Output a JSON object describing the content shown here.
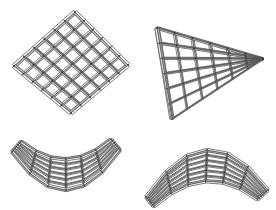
{
  "sheet": {
    "title": "Gridshell Structure Variations",
    "background_color": "#ffffff",
    "width": 276,
    "height": 210
  },
  "render_style": {
    "member_stroke": "#4a4a4a",
    "member_fill_light": "#f2f2f2",
    "member_fill_mid": "#c9c9c9",
    "member_fill_dark": "#8e8e8e",
    "node_color": "#3a3a3a",
    "edge_beam_light": "#e8e8e8",
    "edge_beam_dark": "#9b9b9b",
    "line_width": 0.7
  },
  "figures": [
    {
      "id": "flat-diamond-grid",
      "name": "flat-diamond-grid",
      "label": "Flat square lattice in plan rotated 45 degrees",
      "shape": "diamond",
      "grid_divisions_u": 6,
      "grid_divisions_v": 6,
      "curvature": "flat",
      "outline": [
        [
          75,
          12
        ],
        [
          128,
          65
        ],
        [
          71,
          113
        ],
        [
          14,
          66
        ]
      ],
      "node_count": 49
    },
    {
      "id": "triangular-grid",
      "name": "triangular-grid",
      "label": "Triangular wedge lattice in perspective",
      "shape": "triangle",
      "grid_divisions_u": 6,
      "grid_divisions_v": 6,
      "curvature": "flat",
      "outline": [
        [
          157,
          28
        ],
        [
          263,
          59
        ],
        [
          172,
          119
        ]
      ],
      "node_count": 28
    },
    {
      "id": "saddle-grid",
      "name": "saddle-grid",
      "label": "Anticlastic saddle lattice seen edge on",
      "shape": "saddle-v",
      "grid_divisions_u": 6,
      "grid_divisions_v": 6,
      "curvature": "anticlastic",
      "outline": [
        [
          12,
          152
        ],
        [
          68,
          190
        ],
        [
          120,
          150
        ]
      ],
      "node_count": 28
    },
    {
      "id": "arch-grid",
      "name": "arch-grid",
      "label": "Arched lattice vault seen edge on",
      "shape": "arch-peak",
      "grid_divisions_u": 6,
      "grid_divisions_v": 6,
      "curvature": "synclastic",
      "outline": [
        [
          146,
          197
        ],
        [
          201,
          150
        ],
        [
          268,
          190
        ]
      ],
      "node_count": 28
    }
  ]
}
